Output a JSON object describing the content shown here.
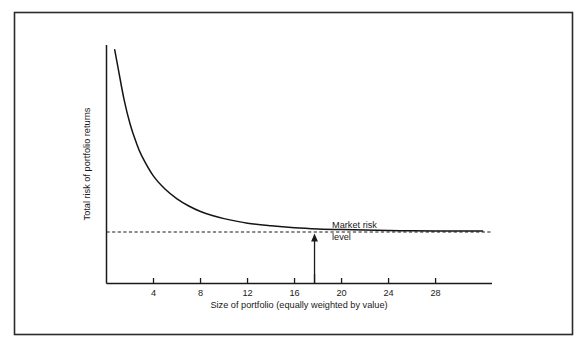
{
  "figure": {
    "name": "portfolio-diversification-risk-chart",
    "border_color": "#2b2b2b",
    "background_color": "#ffffff",
    "line_color": "#1a1a1a"
  },
  "chart_data": {
    "type": "line",
    "title": "",
    "xlabel": "Size of portfolio (equally weighted by value)",
    "ylabel": "Total risk of portfolio returns",
    "xlim": [
      0,
      32.8
    ],
    "ylim": [
      0,
      100
    ],
    "grid": false,
    "legend": null,
    "xticks": [
      4,
      8,
      12,
      16,
      20,
      24,
      28
    ],
    "xtick_labels": [
      "4",
      "8",
      "12",
      "16",
      "20",
      "24",
      "28"
    ],
    "yticks": [],
    "ytick_labels": [],
    "series": [
      {
        "name": "Total risk of portfolio returns",
        "style": "solid",
        "x": [
          0.7,
          1.0,
          1.5,
          2.0,
          2.5,
          3.0,
          4.0,
          5.0,
          6.0,
          7.0,
          8.0,
          9.0,
          10.0,
          12.0,
          14.0,
          16.0,
          18.0,
          20.0,
          22.0,
          24.0,
          26.0,
          28.0,
          30.0,
          32.0
        ],
        "y": [
          98.0,
          90.0,
          77.0,
          67.0,
          59.5,
          53.5,
          45.0,
          39.5,
          35.5,
          32.5,
          30.2,
          28.5,
          27.2,
          25.3,
          24.2,
          23.4,
          22.9,
          22.6,
          22.4,
          22.2,
          22.1,
          22.0,
          22.0,
          22.0
        ]
      },
      {
        "name": "Market risk level",
        "style": "dashed",
        "x": [
          0,
          32.8
        ],
        "y": [
          21.6,
          21.6
        ]
      }
    ],
    "annotations": [
      {
        "name": "market-risk-level-annotation",
        "text_lines": [
          "Market risk",
          "level"
        ],
        "arrow_x": 17.7,
        "arrow_from_y": 0,
        "arrow_to_y": 21.0,
        "tick_x": 17.7
      }
    ]
  }
}
